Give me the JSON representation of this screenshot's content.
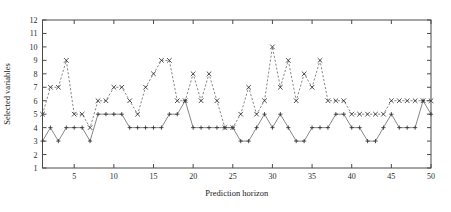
{
  "chart_data": {
    "type": "line",
    "title": "",
    "xlabel": "Prediction horizon",
    "ylabel": "Selected variables",
    "xlim": [
      1,
      50
    ],
    "ylim": [
      1,
      12
    ],
    "xticks": [
      5,
      10,
      15,
      20,
      25,
      30,
      35,
      40,
      45,
      50
    ],
    "xtick_labels": [
      "5",
      "10",
      "15",
      "20",
      "25",
      "30",
      "35",
      "40",
      "45",
      "50"
    ],
    "yticks": [
      1,
      2,
      3,
      4,
      5,
      6,
      7,
      8,
      9,
      10,
      11,
      12
    ],
    "ytick_labels": [
      "1",
      "2",
      "3",
      "4",
      "5",
      "6",
      "7",
      "8",
      "9",
      "10",
      "11",
      "12"
    ],
    "grid": false,
    "legend": "none",
    "x": [
      1,
      2,
      3,
      4,
      5,
      6,
      7,
      8,
      9,
      10,
      11,
      12,
      13,
      14,
      15,
      16,
      17,
      18,
      19,
      20,
      21,
      22,
      23,
      24,
      25,
      26,
      27,
      28,
      29,
      30,
      31,
      32,
      33,
      34,
      35,
      36,
      37,
      38,
      39,
      40,
      41,
      42,
      43,
      44,
      45,
      46,
      47,
      48,
      49,
      50
    ],
    "series": [
      {
        "name": "upper",
        "marker": "x",
        "linestyle": "dashed",
        "values": [
          5,
          7,
          7,
          9,
          5,
          5,
          4,
          6,
          6,
          7,
          7,
          6,
          5,
          7,
          8,
          9,
          9,
          6,
          6,
          8,
          6,
          8,
          6,
          4,
          4,
          5,
          7,
          5,
          6,
          10,
          7,
          9,
          6,
          8,
          7,
          9,
          6,
          6,
          6,
          5,
          5,
          5,
          5,
          5,
          6,
          6,
          6,
          6,
          6,
          6
        ]
      },
      {
        "name": "lower",
        "marker": "+",
        "linestyle": "solid",
        "values": [
          3,
          4,
          3,
          4,
          4,
          4,
          3,
          5,
          5,
          5,
          5,
          4,
          4,
          4,
          4,
          4,
          5,
          5,
          6,
          4,
          4,
          4,
          4,
          4,
          4,
          3,
          3,
          4,
          5,
          4,
          5,
          4,
          3,
          3,
          4,
          4,
          4,
          5,
          5,
          4,
          4,
          3,
          3,
          4,
          5,
          4,
          4,
          4,
          6,
          5
        ]
      }
    ]
  }
}
